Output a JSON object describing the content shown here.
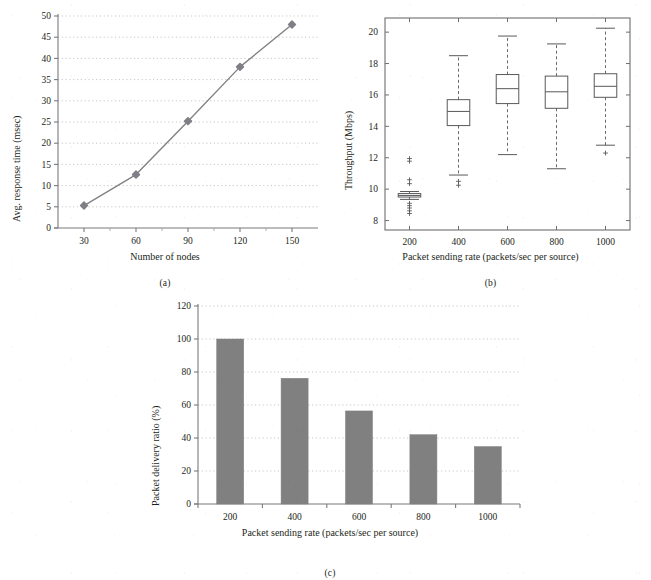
{
  "figure": {
    "background": "#ffffff",
    "panels": [
      {
        "id": "a",
        "caption": "(a)"
      },
      {
        "id": "b",
        "caption": "(b)"
      },
      {
        "id": "c",
        "caption": "(c)"
      }
    ]
  },
  "chart_data": [
    {
      "panel": "a",
      "type": "line",
      "title": "",
      "xlabel": "Number of nodes",
      "ylabel": "Avg. response time (msec)",
      "x": [
        30,
        60,
        90,
        120,
        150
      ],
      "values": [
        5.3,
        12.6,
        25.2,
        38.0,
        48.0
      ],
      "xticks": [
        "30",
        "60",
        "90",
        "120",
        "150"
      ],
      "yticks": [
        "0",
        "5",
        "10",
        "15",
        "20",
        "25",
        "30",
        "35",
        "40",
        "45",
        "50"
      ],
      "xlim": [
        15,
        165
      ],
      "ylim": [
        0,
        50
      ],
      "grid": true,
      "grid_style": "dotted-horizontal",
      "legend": "none",
      "marker": "filled-diamond",
      "series_color": "#808285",
      "marker_color": "#7f7f85"
    },
    {
      "panel": "b",
      "type": "boxplot",
      "title": "",
      "xlabel": "Packet sending rate (packets/sec per source)",
      "ylabel": "Throughput (Mbps)",
      "categories": [
        "200",
        "400",
        "600",
        "800",
        "1000"
      ],
      "xticks": [
        "200",
        "400",
        "600",
        "800",
        "1000"
      ],
      "yticks": [
        "8",
        "10",
        "12",
        "14",
        "16",
        "18",
        "20"
      ],
      "ylim": [
        7.4,
        20.9
      ],
      "grid": false,
      "legend": "none",
      "box_line_color": "#58595b",
      "boxes": [
        {
          "category": "200",
          "whisker_low": 9.35,
          "q1": 9.5,
          "median": 9.6,
          "q3": 9.72,
          "whisker_high": 9.85,
          "outliers": [
            11.95,
            11.78,
            10.6,
            10.35,
            9.1,
            8.95,
            8.8,
            8.62,
            8.45
          ]
        },
        {
          "category": "400",
          "whisker_low": 10.9,
          "q1": 14.05,
          "median": 14.95,
          "q3": 15.7,
          "whisker_high": 18.5,
          "outliers": [
            10.5,
            10.25
          ]
        },
        {
          "category": "600",
          "whisker_low": 12.2,
          "q1": 15.45,
          "median": 16.4,
          "q3": 17.3,
          "whisker_high": 19.75,
          "outliers": []
        },
        {
          "category": "800",
          "whisker_low": 11.3,
          "q1": 15.15,
          "median": 16.2,
          "q3": 17.2,
          "whisker_high": 19.25,
          "outliers": []
        },
        {
          "category": "1000",
          "whisker_low": 12.8,
          "q1": 15.85,
          "median": 16.55,
          "q3": 17.35,
          "whisker_high": 20.25,
          "outliers": [
            12.3
          ]
        }
      ]
    },
    {
      "panel": "c",
      "type": "bar",
      "title": "",
      "xlabel": "Packet sending rate (packets/sec per source)",
      "ylabel": "Packet delivery ratio (%)",
      "categories": [
        "200",
        "400",
        "600",
        "800",
        "1000"
      ],
      "values": [
        100,
        76.2,
        56.4,
        42.0,
        34.8
      ],
      "xticks": [
        "200",
        "400",
        "600",
        "800",
        "1000"
      ],
      "yticks": [
        "0",
        "20",
        "40",
        "60",
        "80",
        "100",
        "120"
      ],
      "ylim": [
        0,
        120
      ],
      "grid": true,
      "grid_style": "dotted-horizontal",
      "legend": "none",
      "bar_color": "#808080"
    }
  ]
}
